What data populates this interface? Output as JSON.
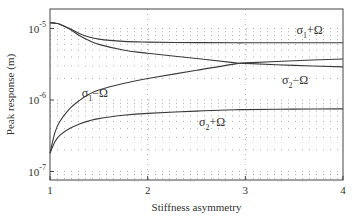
{
  "chart_data": {
    "type": "line",
    "title": "",
    "xlabel": "Stiffness asymmetry",
    "ylabel": "Peak response (m)",
    "xscale": "linear",
    "yscale": "log",
    "xlim": [
      1,
      4
    ],
    "ylim": [
      8e-08,
      1.9e-05
    ],
    "xticks": [
      1,
      2,
      3,
      4
    ],
    "xtick_labels": [
      "1",
      "2",
      "3",
      "4"
    ],
    "yticks": [
      1e-07,
      1e-06,
      1e-05
    ],
    "ytick_labels": [
      {
        "base": "10",
        "exp": "-7"
      },
      {
        "base": "10",
        "exp": "-6"
      },
      {
        "base": "10",
        "exp": "-5"
      }
    ],
    "grid": true,
    "legend": "inline labels",
    "x": [
      1.0,
      1.05,
      1.1,
      1.2,
      1.3,
      1.4,
      1.5,
      1.75,
      2.0,
      2.5,
      2.9,
      3.0,
      3.5,
      4.0
    ],
    "series": [
      {
        "name": "σ1+Ω",
        "label_parts": {
          "sym": "σ",
          "sub": "1",
          "rest": "+Ω"
        },
        "values": [
          1.2e-05,
          1.19e-05,
          1.15e-05,
          1e-05,
          8.5e-06,
          7.6e-06,
          7.1e-06,
          6.6e-06,
          6.45e-06,
          6.35e-06,
          6.3e-06,
          6.3e-06,
          6.3e-06,
          6.3e-06
        ]
      },
      {
        "name": "σ2−Ω",
        "label_parts": {
          "sym": "σ",
          "sub": "2",
          "rest": "−Ω"
        },
        "values": [
          1.2e-05,
          1.19e-05,
          1.15e-05,
          9.8e-06,
          8e-06,
          6.8e-06,
          6e-06,
          5e-06,
          4.5e-06,
          3.8e-06,
          3.3e-06,
          3.25e-06,
          3.05e-06,
          2.9e-06
        ]
      },
      {
        "name": "σ1−Ω",
        "label_parts": {
          "sym": "σ",
          "sub": "1",
          "rest": "−Ω"
        },
        "values": [
          1.8e-07,
          3.5e-07,
          5e-07,
          7.5e-07,
          9.8e-07,
          1.2e-06,
          1.38e-06,
          1.7e-06,
          2e-06,
          2.6e-06,
          3.2e-06,
          3.3e-06,
          3.55e-06,
          3.75e-06
        ]
      },
      {
        "name": "σ2+Ω",
        "label_parts": {
          "sym": "σ",
          "sub": "2",
          "rest": "+Ω"
        },
        "values": [
          1.8e-07,
          2.6e-07,
          3.2e-07,
          4e-07,
          4.6e-07,
          5.1e-07,
          5.5e-07,
          6.1e-07,
          6.5e-07,
          7e-07,
          7.3e-07,
          7.35e-07,
          7.45e-07,
          7.5e-07
        ]
      }
    ],
    "annotations": [
      {
        "series": "σ1+Ω",
        "x": 3.75,
        "y": 9.5e-06
      },
      {
        "series": "σ2−Ω",
        "x": 3.6,
        "y": 1.9e-06
      },
      {
        "series": "σ1−Ω",
        "x": 1.55,
        "y": 1.25e-06
      },
      {
        "series": "σ2+Ω",
        "x": 2.75,
        "y": 5e-07
      }
    ],
    "colors": {
      "line": "#3a3a3a",
      "axis": "#444444",
      "grid": "#9a9a9a"
    }
  }
}
